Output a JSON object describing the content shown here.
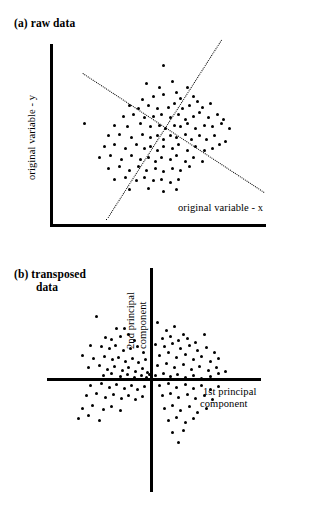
{
  "figure": {
    "caption_a": "(a) raw data",
    "caption_b_line1": "(b) transposed",
    "caption_b_line2": "data"
  },
  "panel_a": {
    "title": "(a) raw data",
    "x_axis_label": "original variable - x",
    "y_axis_label": "original variable - y"
  },
  "panel_b": {
    "title_line1": "(b) transposed",
    "title_line2": "data",
    "x_axis_label_line1": "1st principal",
    "x_axis_label_line2": "component",
    "y_axis_label_line1": "2nd principal",
    "y_axis_label_line2": "component"
  },
  "chart_data": [
    {
      "type": "scatter",
      "title": "(a) raw data",
      "xlabel": "original variable - x",
      "ylabel": "original variable - y",
      "grid": false,
      "legend": "none",
      "axis_style": "solid L-shaped spine, no tick marks, no tick labels",
      "xlim": [
        0,
        100
      ],
      "ylim": [
        0,
        100
      ],
      "annotations": [
        {
          "name": "first-principal-component-line",
          "style": "dashed",
          "x": [
            25,
            79
          ],
          "y": [
            2,
            102
          ]
        },
        {
          "name": "second-principal-component-line",
          "style": "dashed",
          "x": [
            14,
            99
          ],
          "y": [
            84,
            18
          ]
        }
      ],
      "points": [
        [
          52,
          88
        ],
        [
          44,
          78
        ],
        [
          50,
          76
        ],
        [
          56,
          79
        ],
        [
          63,
          76
        ],
        [
          42,
          69
        ],
        [
          47,
          71
        ],
        [
          52,
          72
        ],
        [
          58,
          73
        ],
        [
          60,
          70
        ],
        [
          66,
          71
        ],
        [
          68,
          68
        ],
        [
          36,
          66
        ],
        [
          40,
          64
        ],
        [
          45,
          66
        ],
        [
          49,
          64
        ],
        [
          54,
          65
        ],
        [
          57,
          67
        ],
        [
          61,
          64
        ],
        [
          64,
          66
        ],
        [
          70,
          65
        ],
        [
          74,
          67
        ],
        [
          33,
          60
        ],
        [
          38,
          61
        ],
        [
          43,
          59
        ],
        [
          47,
          60
        ],
        [
          51,
          61
        ],
        [
          55,
          59
        ],
        [
          59,
          61
        ],
        [
          62,
          58
        ],
        [
          66,
          60
        ],
        [
          69,
          62
        ],
        [
          73,
          59
        ],
        [
          77,
          61
        ],
        [
          80,
          58
        ],
        [
          15,
          56
        ],
        [
          29,
          55
        ],
        [
          35,
          54
        ],
        [
          41,
          56
        ],
        [
          46,
          54
        ],
        [
          50,
          55
        ],
        [
          53,
          53
        ],
        [
          57,
          55
        ],
        [
          60,
          54
        ],
        [
          63,
          56
        ],
        [
          67,
          53
        ],
        [
          71,
          55
        ],
        [
          75,
          54
        ],
        [
          79,
          56
        ],
        [
          83,
          53
        ],
        [
          26,
          49
        ],
        [
          31,
          50
        ],
        [
          37,
          48
        ],
        [
          42,
          50
        ],
        [
          46,
          48
        ],
        [
          49,
          49
        ],
        [
          52,
          47
        ],
        [
          55,
          49
        ],
        [
          58,
          48
        ],
        [
          62,
          50
        ],
        [
          65,
          47
        ],
        [
          69,
          49
        ],
        [
          72,
          47
        ],
        [
          76,
          49
        ],
        [
          81,
          46
        ],
        [
          24,
          43
        ],
        [
          29,
          44
        ],
        [
          34,
          42
        ],
        [
          39,
          44
        ],
        [
          43,
          42
        ],
        [
          46,
          43
        ],
        [
          49,
          41
        ],
        [
          52,
          43
        ],
        [
          56,
          42
        ],
        [
          59,
          44
        ],
        [
          63,
          41
        ],
        [
          67,
          43
        ],
        [
          71,
          41
        ],
        [
          75,
          42
        ],
        [
          78,
          44
        ],
        [
          22,
          37
        ],
        [
          27,
          38
        ],
        [
          32,
          36
        ],
        [
          37,
          38
        ],
        [
          41,
          36
        ],
        [
          45,
          37
        ],
        [
          48,
          35
        ],
        [
          51,
          37
        ],
        [
          55,
          36
        ],
        [
          58,
          38
        ],
        [
          62,
          35
        ],
        [
          66,
          37
        ],
        [
          70,
          35
        ],
        [
          26,
          31
        ],
        [
          31,
          32
        ],
        [
          36,
          30
        ],
        [
          40,
          32
        ],
        [
          44,
          30
        ],
        [
          48,
          31
        ],
        [
          52,
          29
        ],
        [
          56,
          31
        ],
        [
          60,
          30
        ],
        [
          64,
          32
        ],
        [
          29,
          25
        ],
        [
          34,
          26
        ],
        [
          39,
          24
        ],
        [
          43,
          26
        ],
        [
          47,
          24
        ],
        [
          51,
          25
        ],
        [
          55,
          23
        ],
        [
          59,
          25
        ],
        [
          36,
          19
        ],
        [
          45,
          20
        ],
        [
          52,
          18
        ],
        [
          58,
          19
        ]
      ]
    },
    {
      "type": "scatter",
      "title": "(b) transposed data",
      "xlabel": "1st principal component",
      "ylabel": "2nd principal component",
      "grid": false,
      "legend": "none",
      "axis_style": "solid crossed axes through origin, no tick marks, no tick labels",
      "xlim": [
        -100,
        100
      ],
      "ylim": [
        -100,
        100
      ],
      "points": [
        [
          -52,
          62
        ],
        [
          -33,
          50
        ],
        [
          -26,
          50
        ],
        [
          -44,
          41
        ],
        [
          -38,
          39
        ],
        [
          -30,
          42
        ],
        [
          -22,
          44
        ],
        [
          -16,
          38
        ],
        [
          -58,
          33
        ],
        [
          -48,
          32
        ],
        [
          -40,
          30
        ],
        [
          -34,
          33
        ],
        [
          -27,
          28
        ],
        [
          -20,
          30
        ],
        [
          -13,
          32
        ],
        [
          -8,
          26
        ],
        [
          -66,
          24
        ],
        [
          -55,
          21
        ],
        [
          -45,
          23
        ],
        [
          -37,
          20
        ],
        [
          -31,
          22
        ],
        [
          -25,
          18
        ],
        [
          -18,
          21
        ],
        [
          -12,
          17
        ],
        [
          -6,
          20
        ],
        [
          -60,
          12
        ],
        [
          -50,
          14
        ],
        [
          -42,
          10
        ],
        [
          -35,
          13
        ],
        [
          -28,
          9
        ],
        [
          -22,
          12
        ],
        [
          -15,
          8
        ],
        [
          -9,
          11
        ],
        [
          -4,
          7
        ],
        [
          -46,
          4
        ],
        [
          -38,
          6
        ],
        [
          -30,
          3
        ],
        [
          -23,
          5
        ],
        [
          -16,
          2
        ],
        [
          -10,
          4
        ],
        [
          -5,
          2
        ],
        [
          -2,
          5
        ],
        [
          -58,
          -6
        ],
        [
          -48,
          -4
        ],
        [
          -40,
          -8
        ],
        [
          -33,
          -5
        ],
        [
          -26,
          -9
        ],
        [
          -19,
          -6
        ],
        [
          -13,
          -10
        ],
        [
          -7,
          -7
        ],
        [
          -62,
          -16
        ],
        [
          -52,
          -14
        ],
        [
          -44,
          -18
        ],
        [
          -36,
          -15
        ],
        [
          -29,
          -19
        ],
        [
          -22,
          -16
        ],
        [
          -15,
          -20
        ],
        [
          -9,
          -17
        ],
        [
          -66,
          -28
        ],
        [
          -56,
          -25
        ],
        [
          -46,
          -29
        ],
        [
          -38,
          -26
        ],
        [
          -30,
          -30
        ],
        [
          -70,
          -38
        ],
        [
          -60,
          -35
        ],
        [
          -50,
          -40
        ],
        [
          6,
          56
        ],
        [
          14,
          48
        ],
        [
          22,
          52
        ],
        [
          30,
          44
        ],
        [
          10,
          40
        ],
        [
          18,
          42
        ],
        [
          26,
          38
        ],
        [
          34,
          40
        ],
        [
          42,
          36
        ],
        [
          50,
          44
        ],
        [
          4,
          34
        ],
        [
          12,
          32
        ],
        [
          20,
          35
        ],
        [
          28,
          30
        ],
        [
          36,
          33
        ],
        [
          44,
          28
        ],
        [
          52,
          31
        ],
        [
          60,
          26
        ],
        [
          8,
          24
        ],
        [
          16,
          26
        ],
        [
          24,
          22
        ],
        [
          32,
          25
        ],
        [
          40,
          20
        ],
        [
          48,
          23
        ],
        [
          56,
          18
        ],
        [
          64,
          21
        ],
        [
          6,
          14
        ],
        [
          14,
          16
        ],
        [
          22,
          12
        ],
        [
          30,
          15
        ],
        [
          38,
          10
        ],
        [
          46,
          13
        ],
        [
          54,
          9
        ],
        [
          62,
          12
        ],
        [
          70,
          8
        ],
        [
          4,
          4
        ],
        [
          11,
          6
        ],
        [
          18,
          3
        ],
        [
          25,
          5
        ],
        [
          32,
          2
        ],
        [
          40,
          4
        ],
        [
          48,
          1
        ],
        [
          56,
          3
        ],
        [
          64,
          6
        ],
        [
          8,
          -6
        ],
        [
          16,
          -4
        ],
        [
          24,
          -8
        ],
        [
          32,
          -5
        ],
        [
          40,
          -9
        ],
        [
          48,
          -6
        ],
        [
          56,
          -10
        ],
        [
          64,
          -7
        ],
        [
          10,
          -16
        ],
        [
          18,
          -14
        ],
        [
          26,
          -18
        ],
        [
          34,
          -15
        ],
        [
          42,
          -19
        ],
        [
          50,
          -16
        ],
        [
          58,
          -20
        ],
        [
          12,
          -28
        ],
        [
          20,
          -25
        ],
        [
          28,
          -30
        ],
        [
          36,
          -26
        ],
        [
          44,
          -32
        ],
        [
          52,
          -28
        ],
        [
          16,
          -40
        ],
        [
          24,
          -37
        ],
        [
          32,
          -42
        ],
        [
          40,
          -38
        ],
        [
          20,
          -52
        ],
        [
          30,
          -50
        ],
        [
          26,
          -62
        ]
      ]
    }
  ]
}
